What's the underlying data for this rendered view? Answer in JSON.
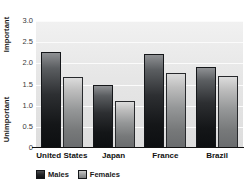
{
  "chart_data": {
    "type": "bar",
    "title": "",
    "xlabel": "",
    "ylabel": "",
    "categories": [
      "United States",
      "Japan",
      "France",
      "Brazil"
    ],
    "series": [
      {
        "name": "Males",
        "color": "#1a1c1f",
        "values": [
          2.27,
          1.5,
          2.22,
          1.92
        ]
      },
      {
        "name": "Females",
        "color": "#8f9192",
        "values": [
          1.67,
          1.1,
          1.78,
          1.7
        ]
      }
    ],
    "ylim": [
      0,
      3.0
    ],
    "yticks": [
      "3.0",
      "2.5",
      "2.0",
      "1.5",
      "1.0",
      "0.5",
      "0"
    ],
    "ytick_values": [
      3.0,
      2.5,
      2.0,
      1.5,
      1.0,
      0.5,
      0
    ],
    "axis_group_labels": {
      "top": "Important",
      "bottom": "Unimportant"
    },
    "grid": true,
    "legend_position": "bottom-left",
    "plot_background": "#e8e8e8",
    "gridline_color": "#fbfbfb"
  },
  "axis": {
    "important_label": "Important",
    "unimportant_label": "Unimportant"
  },
  "legend": {
    "items": [
      {
        "label": "Males"
      },
      {
        "label": "Females"
      }
    ]
  }
}
